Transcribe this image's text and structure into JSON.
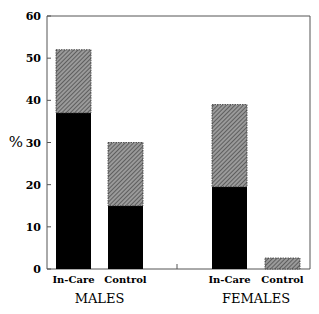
{
  "chart_data": {
    "type": "bar",
    "stacked": true,
    "title": "",
    "xlabel": "",
    "ylabel": "%",
    "ylim": [
      0,
      60
    ],
    "yticks": [
      0,
      10,
      20,
      30,
      40,
      50,
      60
    ],
    "grid": false,
    "legend": null,
    "groups": [
      "MALES",
      "FEMALES"
    ],
    "categories": [
      "In-Care",
      "Control",
      "In-Care",
      "Control"
    ],
    "category_groups": [
      "MALES",
      "MALES",
      "FEMALES",
      "FEMALES"
    ],
    "series": [
      {
        "name": "solid (black)",
        "color": "#000000",
        "values": [
          37,
          15,
          19.5,
          0
        ]
      },
      {
        "name": "hatched (grey)",
        "color": "#7a7a7a",
        "values": [
          15,
          15,
          19.5,
          2.6
        ]
      }
    ],
    "totals": [
      52,
      30,
      39,
      2.6
    ]
  }
}
